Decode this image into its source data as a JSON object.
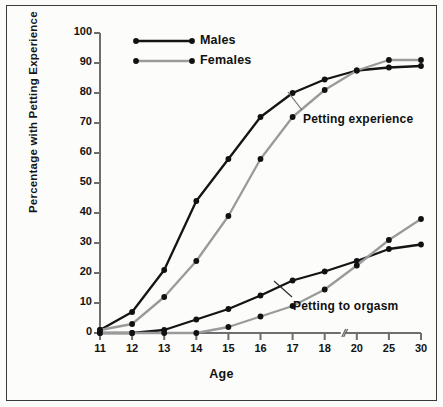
{
  "chart_data": {
    "type": "line",
    "title": "",
    "xlabel": "Age",
    "ylabel": "Percentage with Petting Experience",
    "categories": [
      "11",
      "12",
      "13",
      "14",
      "15",
      "16",
      "17",
      "18",
      "20",
      "25",
      "30"
    ],
    "x_tick_labels": [
      "11",
      "12",
      "13",
      "14",
      "15",
      "16",
      "17",
      "18",
      "20",
      "25",
      "30"
    ],
    "y_tick_labels": [
      "0",
      "10",
      "20",
      "30",
      "40",
      "50",
      "60",
      "70",
      "80",
      "90",
      "100"
    ],
    "ylim": [
      0,
      100
    ],
    "y_step": 10,
    "grid": false,
    "legend_position": "top-center",
    "axis_break": {
      "between": [
        "18",
        "20"
      ],
      "symbol": "//"
    },
    "legend": [
      {
        "name": "Males",
        "color": "#141414"
      },
      {
        "name": "Females",
        "color": "#9a9a9a"
      }
    ],
    "annotations": [
      {
        "text": "Petting experience",
        "near_x": "18",
        "near_y": 72
      },
      {
        "text": "Petting to orgasm",
        "near_x": "19",
        "near_y": 9
      }
    ],
    "series": [
      {
        "name": "Males",
        "group": "Petting experience",
        "color": "#141414",
        "values": [
          1,
          7,
          21,
          44,
          58,
          72,
          80,
          84.5,
          87.5,
          88.5,
          89
        ]
      },
      {
        "name": "Females",
        "group": "Petting experience",
        "color": "#9a9a9a",
        "values": [
          1,
          3,
          12,
          24,
          39,
          58,
          72,
          81,
          87.5,
          91,
          91
        ]
      },
      {
        "name": "Males",
        "group": "Petting to orgasm",
        "color": "#141414",
        "values": [
          0,
          0,
          1,
          4.5,
          8,
          12.5,
          17.5,
          20.5,
          24,
          28,
          29.5
        ]
      },
      {
        "name": "Females",
        "group": "Petting to orgasm",
        "color": "#9a9a9a",
        "values": [
          0,
          0,
          0,
          0,
          2,
          5.5,
          9,
          14.5,
          22.5,
          31,
          38
        ]
      }
    ]
  }
}
